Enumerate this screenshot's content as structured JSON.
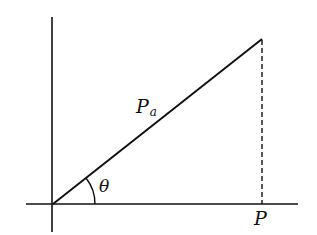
{
  "diagram": {
    "type": "vector-projection",
    "colors": {
      "stroke": "#111111",
      "background": "#ffffff"
    },
    "axes": {
      "vertical": {
        "x": 52,
        "y1": 17,
        "y2": 232
      },
      "horizontal": {
        "y": 204,
        "x1": 26,
        "x2": 298
      }
    },
    "vector": {
      "label": "P",
      "subscript": "a",
      "from": [
        53,
        204
      ],
      "to": [
        262,
        39
      ]
    },
    "projection_line": {
      "style": "dashed",
      "from": [
        262,
        39
      ],
      "to": [
        262,
        204
      ]
    },
    "angle": {
      "label": "θ",
      "radius": 42
    },
    "projection_point": {
      "label": "P"
    }
  }
}
